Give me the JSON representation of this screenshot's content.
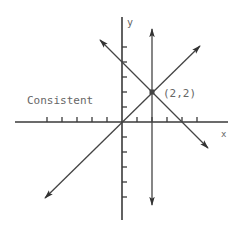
{
  "diagram": {
    "type": "system-of-linear-equations-graph",
    "caption": "Consistent",
    "axis_labels": {
      "x": "x",
      "y": "y"
    },
    "tick_range": {
      "x": [
        -5,
        5
      ],
      "y": [
        -5,
        5
      ]
    },
    "lines": [
      {
        "name": "vertical-line",
        "equation": "x = 2"
      },
      {
        "name": "increasing-line",
        "equation": "y = x"
      },
      {
        "name": "decreasing-line",
        "equation": "y = -x + 4"
      }
    ],
    "intersection_point": {
      "x": 2,
      "y": 2,
      "label": "(2,2)"
    },
    "colors": {
      "ink": "#3a3a3a",
      "label": "#666666",
      "background": "#ffffff"
    }
  }
}
